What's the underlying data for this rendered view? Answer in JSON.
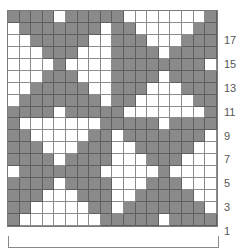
{
  "chart": {
    "columns": 18,
    "rows": 18,
    "colors": {
      "filled": "#8a8a8a",
      "empty": "#ffffff",
      "grid": "#8c8c8c"
    },
    "row_labels": [
      "17",
      "15",
      "13",
      "11",
      "9",
      "7",
      "5",
      "3",
      "1"
    ],
    "row_label_rows": [
      17,
      15,
      13,
      11,
      9,
      7,
      5,
      3,
      1
    ],
    "grid_top_to_bottom": [
      "GGGGWGGGGGWWWWWWWG",
      "WGGGGGGGWGGWWWWWGG",
      "WWGGGGGWWGGGWWWGGG",
      "WWWGGGWWWGGGGWGGGG",
      "WWWWGWWWWGGGGGGGGW",
      "WWWGGGWWWGGGGWGGGG",
      "WWGGGGGWWGGGWWWGGG",
      "WGGGGGGGWGGWWWWWGG",
      "GGGGWGGGGGWWWWWWWG",
      "GWWWWWWWGGGGGWGGGG",
      "GGWWWWWGGWGGGGGGGW",
      "GGGWWWGGGWWGGGGGWW",
      "GGGGWGGGGWWWGGGWWW",
      "WGGGGGGGWWWWWGWWWW",
      "GGGGWGGGGWWWGGGWWW",
      "GGGWWWGGGWWGGGGGWW",
      "GGWWWWWGGWGGGGGGGW",
      "GWWWWWWWGGGGGWGGGG"
    ],
    "legend": "G = contrast color (filled), W = main color (empty)"
  },
  "chart_data": {
    "type": "heatmap",
    "title": "",
    "xlabel": "",
    "ylabel": "",
    "row_tick_labels": [
      "1",
      "3",
      "5",
      "7",
      "9",
      "11",
      "13",
      "15",
      "17"
    ],
    "grid": "18x18 binary stitch chart; see chart.grid_top_to_bottom"
  },
  "bracket": {
    "label": ""
  }
}
